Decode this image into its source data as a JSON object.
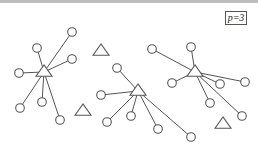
{
  "label": "p=3",
  "colors": {
    "stroke": "#555555",
    "fill": "#ffffff",
    "topbar": "#bdbdbd"
  },
  "clusters": [
    {
      "name": "cluster-1",
      "center": [
        44,
        72
      ],
      "leaves": [
        [
          72,
          32
        ],
        [
          37,
          48
        ],
        [
          72,
          59
        ],
        [
          19,
          73
        ],
        [
          20,
          108
        ],
        [
          42,
          102
        ],
        [
          60,
          120
        ]
      ]
    },
    {
      "name": "cluster-2",
      "center": [
        138,
        91
      ],
      "leaves": [
        [
          117,
          68
        ],
        [
          101,
          95
        ],
        [
          107,
          122
        ],
        [
          131,
          116
        ],
        [
          158,
          129
        ],
        [
          191,
          137
        ]
      ]
    },
    {
      "name": "cluster-3",
      "center": [
        195,
        72
      ],
      "leaves": [
        [
          152,
          49
        ],
        [
          191,
          47
        ],
        [
          172,
          83
        ],
        [
          220,
          84
        ],
        [
          245,
          82
        ],
        [
          210,
          103
        ],
        [
          242,
          116
        ]
      ]
    }
  ],
  "isolated_triangles": [
    [
      101,
      51
    ],
    [
      83,
      111
    ],
    [
      223,
      124
    ]
  ]
}
